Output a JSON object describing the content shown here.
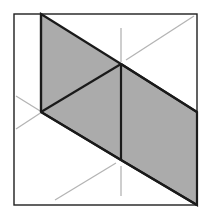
{
  "canvas": {
    "width": 212,
    "height": 220,
    "background_color": "#ffffff",
    "description": "Isometric geometric line figure: a shaded hexagonal band of triangles inside a thin square frame, with faint light-grey construction lines."
  },
  "colors": {
    "background": "#ffffff",
    "frame_stroke": "#1f1f1f",
    "shape_fill": "#ababab",
    "shape_stroke": "#1a1a1a",
    "construction_line": "#b4b4b4"
  },
  "frame": {
    "name": "outer-square-frame",
    "x": 14,
    "y": 14,
    "width": 183,
    "height": 191,
    "stroke_width": 1.4,
    "fill": "none"
  },
  "shaded_shape": {
    "name": "shaded-triangle-band",
    "fill": "#ababab",
    "stroke": "#1a1a1a",
    "stroke_width": 2.2,
    "points": "41,14 121,64 197,112 197,205 121,160 41,112",
    "vertices": [
      {
        "label": "top-left",
        "x": 41,
        "y": 14
      },
      {
        "label": "upper-center",
        "x": 121,
        "y": 64
      },
      {
        "label": "right-upper",
        "x": 197,
        "y": 112
      },
      {
        "label": "bottom-right",
        "x": 197,
        "y": 205
      },
      {
        "label": "lower-center",
        "x": 121,
        "y": 160
      },
      {
        "label": "left-center",
        "x": 41,
        "y": 112
      }
    ]
  },
  "interior_edges": [
    {
      "name": "left-vertical-edge",
      "x1": 41,
      "y1": 14,
      "x2": 41,
      "y2": 112
    },
    {
      "name": "center-vertical-edge",
      "x1": 121,
      "y1": 64,
      "x2": 121,
      "y2": 160
    },
    {
      "name": "upper-left-diagonal",
      "x1": 41,
      "y1": 112,
      "x2": 121,
      "y2": 64
    },
    {
      "name": "upper-right-diagonal",
      "x1": 121,
      "y1": 64,
      "x2": 197,
      "y2": 112
    },
    {
      "name": "lower-left-diagonal",
      "x1": 41,
      "y1": 112,
      "x2": 121,
      "y2": 160
    },
    {
      "name": "lower-right-diagonal",
      "x1": 121,
      "y1": 160,
      "x2": 197,
      "y2": 205
    }
  ],
  "construction_lines": [
    {
      "name": "upper-center-vertical-guide",
      "x1": 121,
      "y1": 28,
      "x2": 121,
      "y2": 62
    },
    {
      "name": "lower-center-vertical-guide",
      "x1": 121,
      "y1": 166,
      "x2": 121,
      "y2": 196
    },
    {
      "name": "upper-right-diagonal-guide",
      "x1": 126,
      "y1": 60,
      "x2": 194,
      "y2": 16
    },
    {
      "name": "lower-left-diagonal-guide",
      "x1": 55,
      "y1": 200,
      "x2": 116,
      "y2": 163
    },
    {
      "name": "left-upper-crossing-guide",
      "x1": 16,
      "y1": 96,
      "x2": 45,
      "y2": 114
    },
    {
      "name": "left-lower-crossing-guide",
      "x1": 16,
      "y1": 129,
      "x2": 45,
      "y2": 110
    }
  ]
}
